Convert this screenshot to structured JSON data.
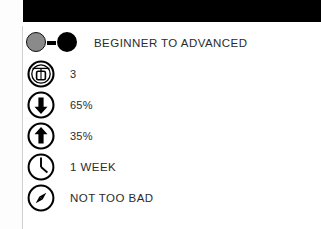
{
  "document": {
    "title": "Ski Resort Stats Panel",
    "top_bar_color": "#000000",
    "background_color": "#ffffff",
    "text_color": "#2b2b2b",
    "accent_gray": "#8a8a8a"
  },
  "rows": [
    {
      "icon": "difficulty-dots-icon",
      "label": "BEGINNER TO ADVANCED",
      "style": "caps"
    },
    {
      "icon": "gondola-icon",
      "label": "3",
      "style": "num"
    },
    {
      "icon": "arrow-down-circle-icon",
      "label": "65%",
      "style": "num"
    },
    {
      "icon": "arrow-up-circle-icon",
      "label": "35%",
      "style": "num"
    },
    {
      "icon": "clock-icon",
      "label": "1 WEEK",
      "style": "caps"
    },
    {
      "icon": "compass-icon",
      "label": "NOT TOO BAD",
      "style": "caps"
    }
  ]
}
